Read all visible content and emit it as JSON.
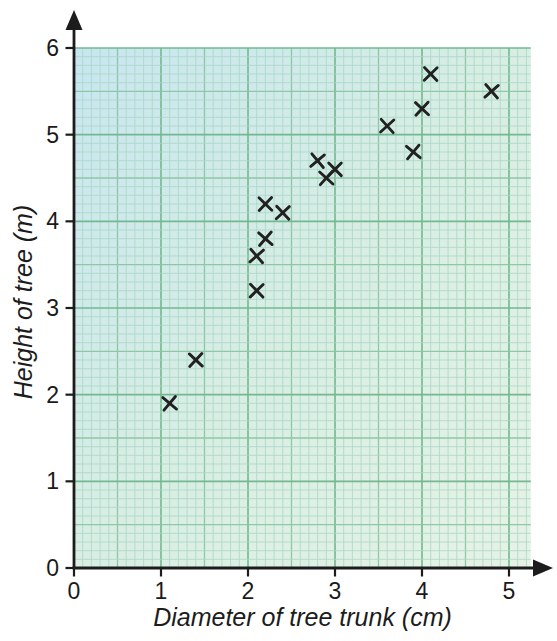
{
  "chart_data": {
    "type": "scatter",
    "title": "",
    "xlabel": "Diameter of tree trunk (cm)",
    "ylabel": "Height of tree (m)",
    "xlim": [
      0,
      5.25
    ],
    "ylim": [
      0,
      6
    ],
    "x_ticks": [
      0,
      1,
      2,
      3,
      4,
      5
    ],
    "y_ticks": [
      0,
      1,
      2,
      3,
      4,
      5,
      6
    ],
    "grid": {
      "style": "graph-paper",
      "minor_step": 0.1,
      "medium_step": 0.5,
      "major_step": 1.0
    },
    "legend": null,
    "marker": "x",
    "points": [
      [
        1.1,
        1.9
      ],
      [
        1.4,
        2.4
      ],
      [
        2.1,
        3.2
      ],
      [
        2.1,
        3.6
      ],
      [
        2.2,
        3.8
      ],
      [
        2.2,
        4.2
      ],
      [
        2.4,
        4.1
      ],
      [
        2.8,
        4.7
      ],
      [
        2.9,
        4.5
      ],
      [
        3.0,
        4.6
      ],
      [
        3.6,
        5.1
      ],
      [
        3.9,
        4.8
      ],
      [
        4.0,
        5.3
      ],
      [
        4.1,
        5.7
      ],
      [
        4.8,
        5.5
      ]
    ],
    "colors": {
      "paper_tint_topleft": "#c7e6ef",
      "paper_tint_mid": "#d8eee3",
      "paper_tint_bottomright": "#e5f3e5",
      "grid_minor": "#abd8c9",
      "grid_medium": "#8bc6a5",
      "grid_major": "#72b890",
      "axis": "#1c1c1c",
      "tick_label": "#1a1a1a",
      "marker": "#212121",
      "page_bg": "#ffffff"
    }
  }
}
